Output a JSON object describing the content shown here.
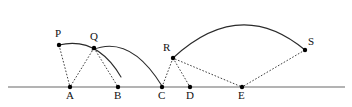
{
  "figure": {
    "width": 352,
    "height": 107,
    "background_color": "#ffffff",
    "stroke_color": "#2a2a2a",
    "baseline_color": "#9a9a9a",
    "dot_color": "#000000"
  },
  "baseline": {
    "name": "horizontal-axis",
    "x1": 8,
    "y1": 87,
    "x2": 345,
    "y2": 87
  },
  "labels": {
    "A": "A",
    "B": "B",
    "C": "C",
    "D": "D",
    "E": "E",
    "P": "P",
    "Q": "Q",
    "R": "R",
    "S": "S"
  },
  "base_points": [
    {
      "id": "A",
      "label": "A",
      "x": 70,
      "y": 87,
      "label_x": 66,
      "label_y": 90
    },
    {
      "id": "B",
      "label": "B",
      "x": 118,
      "y": 87,
      "label_x": 114,
      "label_y": 90
    },
    {
      "id": "C",
      "label": "C",
      "x": 162,
      "y": 87,
      "label_x": 158,
      "label_y": 90
    },
    {
      "id": "D",
      "label": "D",
      "x": 190,
      "y": 87,
      "label_x": 186,
      "label_y": 90
    },
    {
      "id": "E",
      "label": "E",
      "x": 242,
      "y": 87,
      "label_x": 238,
      "label_y": 90
    }
  ],
  "arc_points": [
    {
      "id": "P",
      "label": "P",
      "x": 59,
      "y": 45,
      "label_x": 55,
      "label_y": 28
    },
    {
      "id": "Q",
      "label": "Q",
      "x": 94,
      "y": 48,
      "label_x": 90,
      "label_y": 31
    },
    {
      "id": "R",
      "label": "R",
      "x": 173,
      "y": 58,
      "label_x": 163,
      "label_y": 42
    },
    {
      "id": "S",
      "label": "S",
      "x": 305,
      "y": 50,
      "label_x": 308,
      "label_y": 36
    }
  ],
  "arcs": [
    {
      "id": "arc-P-Q-B",
      "name": "arc-centered-at-A",
      "path": "M 59 45 Q 97 36 121 77",
      "from": "P",
      "to": "B"
    },
    {
      "id": "arc-Q-C",
      "name": "arc-centered-at-B",
      "path": "M 92 50 Q 130 34 162 86",
      "from": "Q",
      "to": "C"
    },
    {
      "id": "arc-R-S",
      "name": "arc-centered-at-E",
      "path": "M 173 58 Q 240 -4 305 50",
      "from": "R",
      "to": "S"
    }
  ],
  "radii": [
    {
      "id": "P-A",
      "name": "radius-P-to-A",
      "x1": 59,
      "y1": 45,
      "x2": 70,
      "y2": 87
    },
    {
      "id": "Q-A",
      "name": "radius-Q-to-A",
      "x1": 94,
      "y1": 48,
      "x2": 70,
      "y2": 87
    },
    {
      "id": "Q-B",
      "name": "radius-Q-to-B",
      "x1": 94,
      "y1": 48,
      "x2": 118,
      "y2": 87
    },
    {
      "id": "R-C",
      "name": "radius-R-to-C",
      "x1": 173,
      "y1": 58,
      "x2": 162,
      "y2": 87
    },
    {
      "id": "R-D",
      "name": "radius-R-to-D",
      "x1": 173,
      "y1": 58,
      "x2": 190,
      "y2": 87
    },
    {
      "id": "R-E",
      "name": "radius-R-to-E",
      "x1": 175,
      "y1": 59,
      "x2": 242,
      "y2": 87
    },
    {
      "id": "S-E",
      "name": "radius-S-to-E",
      "x1": 305,
      "y1": 50,
      "x2": 242,
      "y2": 87
    }
  ]
}
